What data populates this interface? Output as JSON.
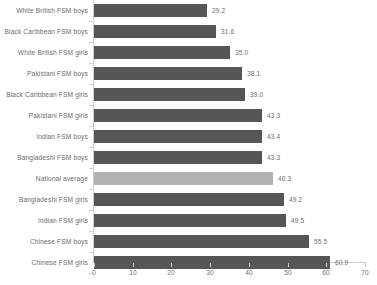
{
  "chart_data": {
    "type": "bar",
    "orientation": "horizontal",
    "title": "",
    "subtitle": "",
    "xlabel": "",
    "ylabel": "",
    "xlim": [
      0,
      70
    ],
    "xticks": [
      0,
      10,
      20,
      30,
      40,
      50,
      60,
      70
    ],
    "grid": false,
    "legend": false,
    "bar_color": "#565656",
    "highlight_color": "#b2b2b2",
    "highlight_category": "National average",
    "categories": [
      "White British FSM boys",
      "Black Caribbean FSM boys",
      "White British FSM girls",
      "Pakistani FSM boys",
      "Black Caribbean FSM girls",
      "Pakistani FSM girls",
      "Indian FSM boys",
      "Bangladeshi FSM boys",
      "National average",
      "Bangladeshi FSM girls",
      "Indian FSM girls",
      "Chinese FSM boys",
      "Chinese FSM girls"
    ],
    "values": [
      29.2,
      31.6,
      35.0,
      38.1,
      39.0,
      43.3,
      43.4,
      43.3,
      46.3,
      49.2,
      49.5,
      55.5,
      60.9
    ],
    "value_labels": [
      "29.2",
      "31.6",
      "35.0",
      "38.1",
      "39.0",
      "43.3",
      "43.4",
      "43.3",
      "46.3",
      "49.2",
      "49.5",
      "55.5",
      "60.9"
    ],
    "tick_labels": [
      "0",
      "10",
      "20",
      "30",
      "40",
      "50",
      "60",
      "70"
    ]
  }
}
